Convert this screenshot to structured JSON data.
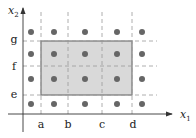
{
  "diagram": {
    "x_axis_label": "x",
    "x_axis_sub": "1",
    "y_axis_label": "x",
    "y_axis_sub": "2",
    "x_ticks": [
      "a",
      "b",
      "c",
      "d"
    ],
    "y_ticks": [
      "e",
      "f",
      "g"
    ],
    "highlight_region": {
      "x_from": "a",
      "x_to": "d",
      "y_from": "e",
      "y_to": "g",
      "fill": "#d9d9d9",
      "stroke": "#777777"
    },
    "point_columns": 5,
    "point_rows": 4,
    "point_color": "#666666",
    "grid_line_color": "#999999"
  }
}
